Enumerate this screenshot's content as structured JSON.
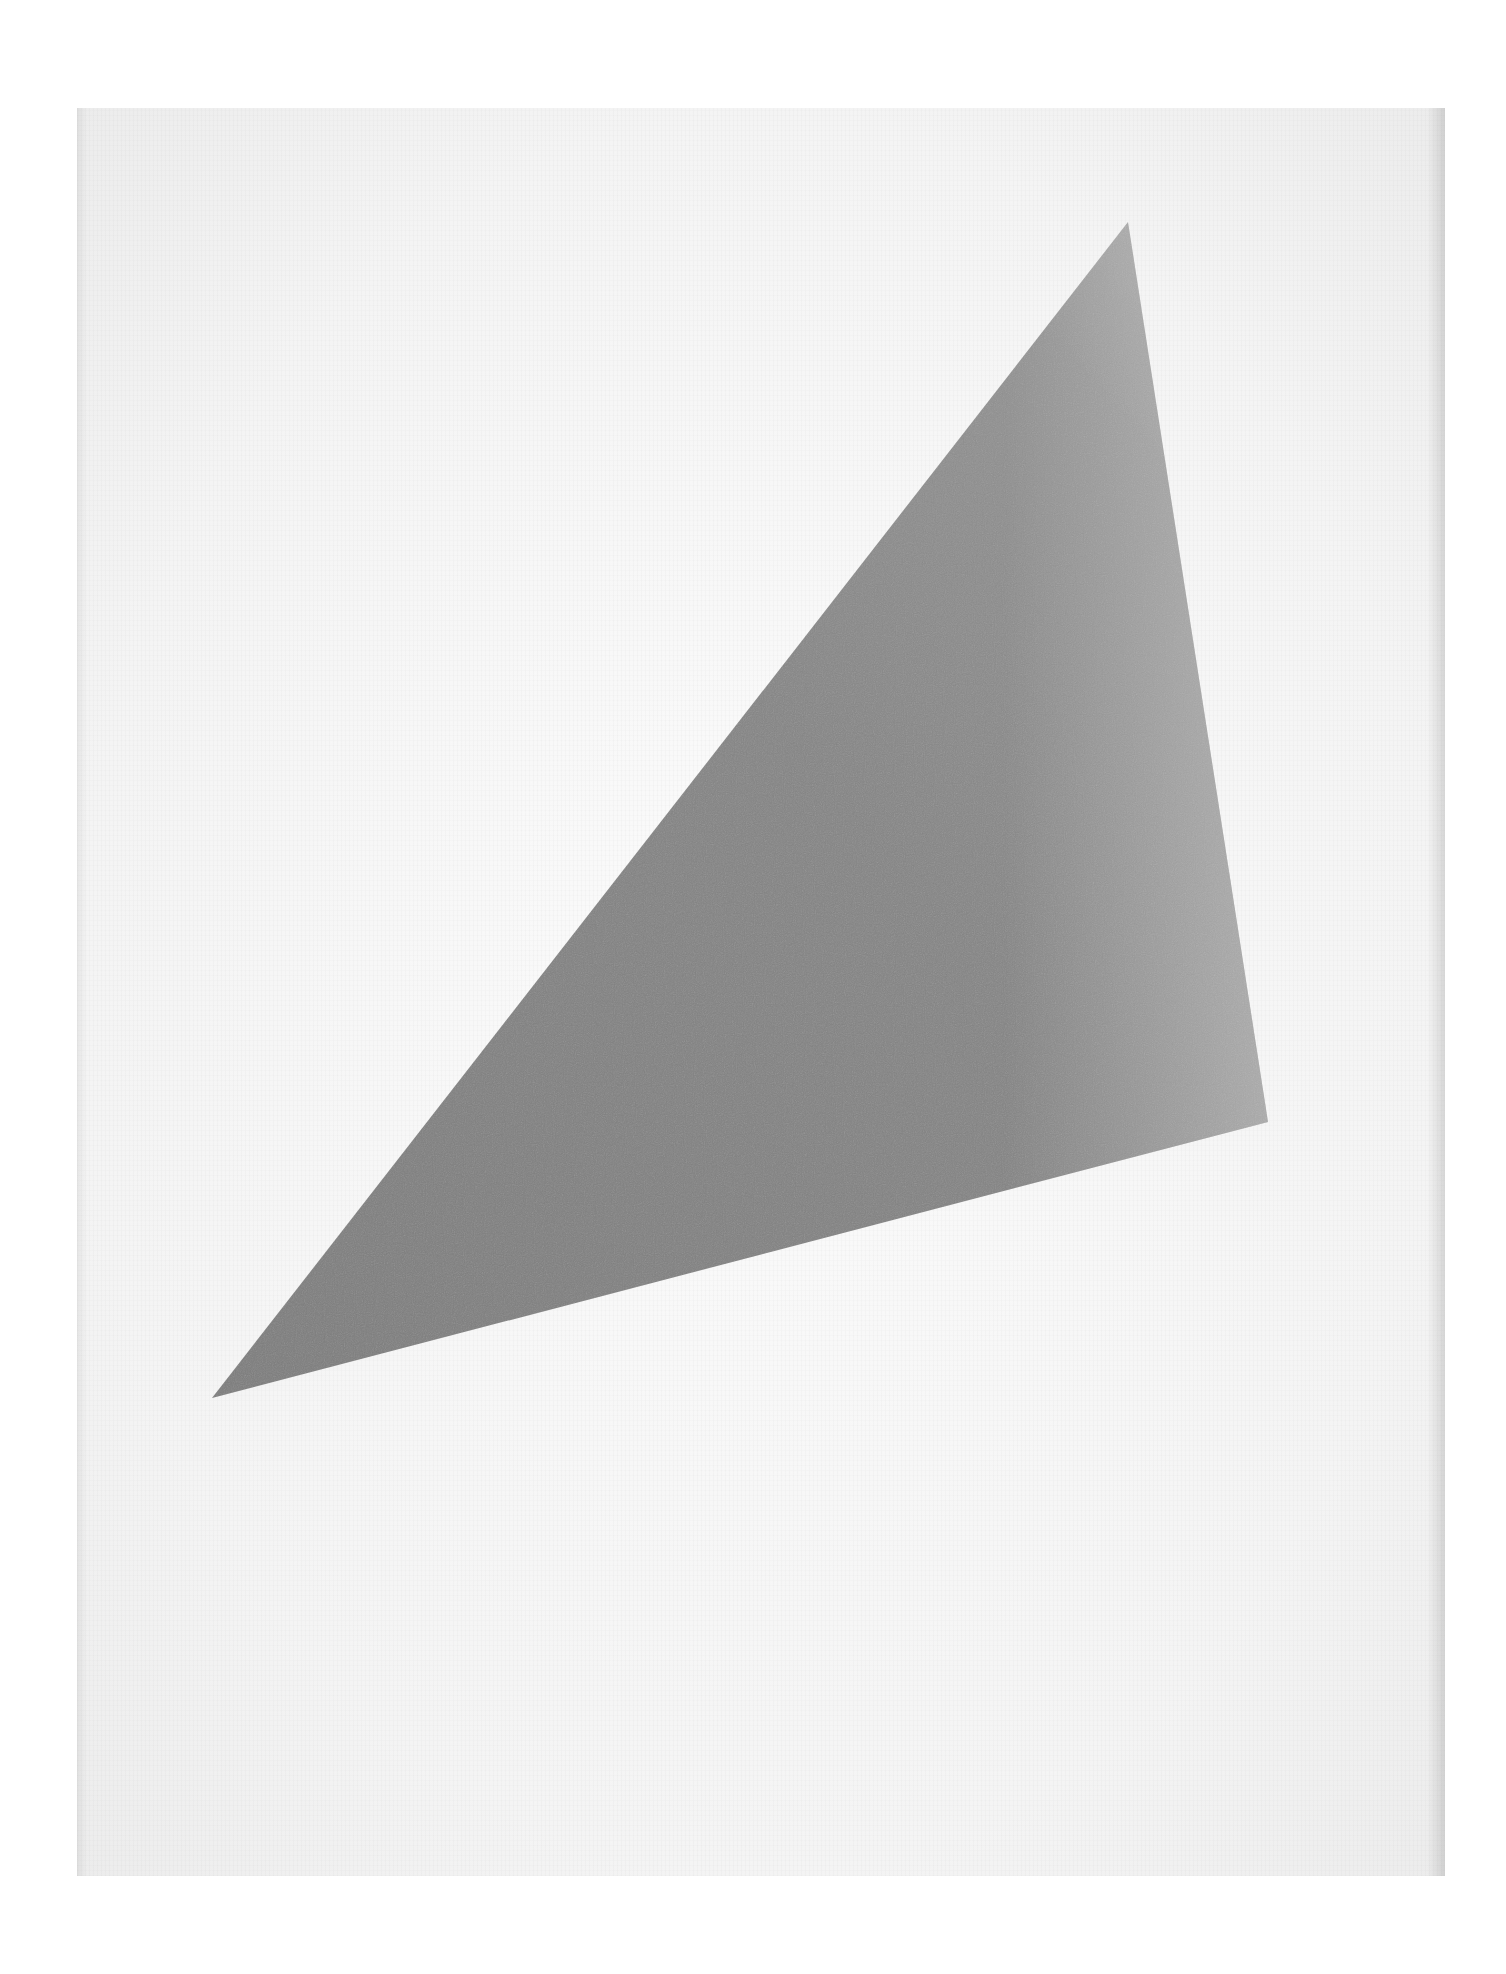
{
  "artwork": {
    "subject": "gray triangle on white ground",
    "colors": {
      "background": "#ffffff",
      "paper": "#f4f4f4",
      "triangle_dark": "#7a7a7a",
      "triangle_mid": "#8c8c8c",
      "triangle_light": "#a6a6a6"
    },
    "triangle": {
      "points": [
        [
          1128,
          222
        ],
        [
          212,
          1398
        ],
        [
          1268,
          1122
        ]
      ]
    }
  }
}
